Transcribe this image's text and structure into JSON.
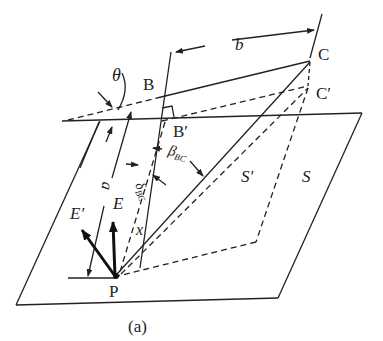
{
  "figure": {
    "caption": "(a)",
    "points": {
      "B": "B",
      "B_prime": "B′",
      "C": "C",
      "C_prime": "C′",
      "P": "P"
    },
    "vectors": {
      "E": "E",
      "E_prime": "E′"
    },
    "planes": {
      "S": "S",
      "S_prime": "S′"
    },
    "dimensions": {
      "a": "a",
      "b": "b",
      "x": "x"
    },
    "angles": {
      "theta": "θ",
      "beta": "β",
      "beta_sub": "BC",
      "delta": "δ",
      "delta_sub": "BC"
    }
  },
  "colors": {
    "ink": "#222222",
    "background": "#ffffff"
  }
}
